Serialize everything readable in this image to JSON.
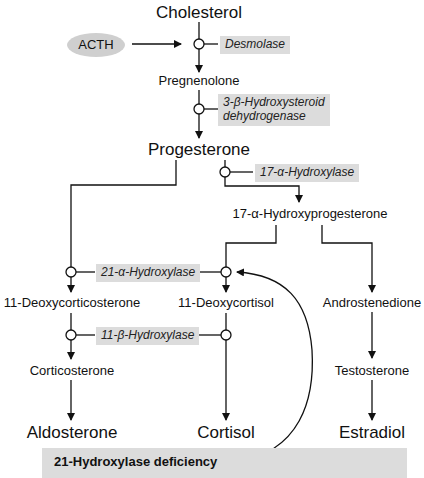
{
  "diagram": {
    "stimulus": {
      "label": "ACTH",
      "color": "#cfcfcf"
    },
    "metabolites": {
      "cholesterol": "Cholesterol",
      "pregnenolone": "Pregnenolone",
      "progesterone": "Progesterone",
      "hydroxyprogesterone": "17-α-Hydroxyprogesterone",
      "deoxycorticosterone": "11-Deoxycorticosterone",
      "deoxycortisol": "11-Deoxycortisol",
      "androstenedione": "Androstenedione",
      "corticosterone": "Corticosterone",
      "testosterone": "Testosterone",
      "aldosterone": "Aldosterone",
      "cortisol": "Cortisol",
      "estradiol": "Estradiol"
    },
    "enzymes": {
      "desmolase": "Desmolase",
      "hsd_line1": "3-β-Hydroxysteroid",
      "hsd_line2": "dehydrogenase",
      "hydroxylase17": "17-α-Hydroxylase",
      "hydroxylase21": "21-α-Hydroxylase",
      "hydroxylase11": "11-β-Hydroxylase"
    },
    "deficiency": {
      "label": "21-Hydroxylase deficiency",
      "color": "#dcdcdc"
    },
    "colors": {
      "line": "#111111",
      "enzyme_box": "#dcdcdc"
    }
  }
}
